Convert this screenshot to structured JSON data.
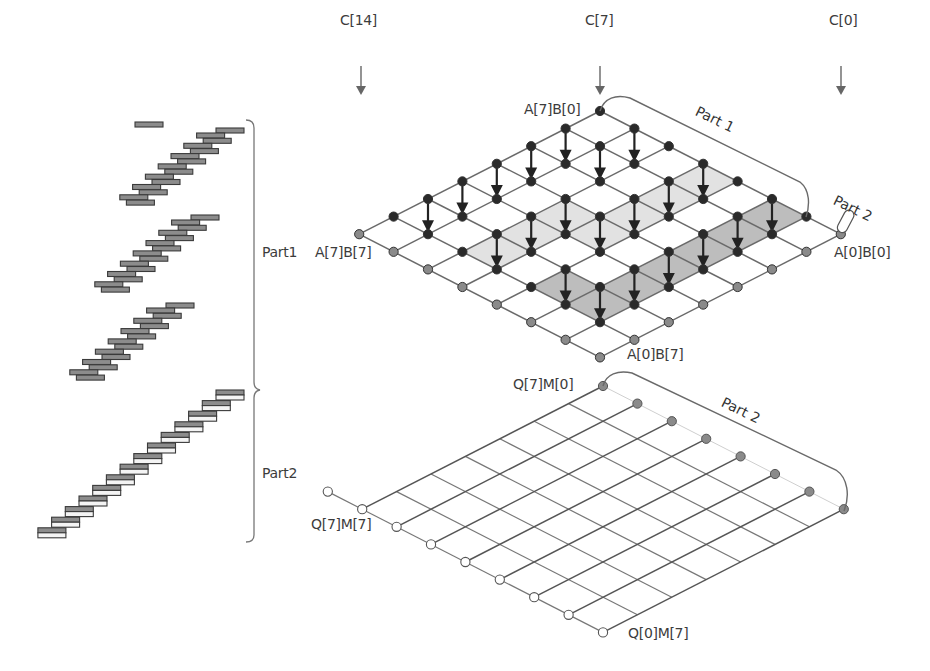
{
  "labels": {
    "c14": "C[14]",
    "c7": "C[7]",
    "c0": "C[0]",
    "a7b0": "A[7]B[0]",
    "a7b7": "A[7]B[7]",
    "a0b0": "A[0]B[0]",
    "a0b7": "A[0]B[7]",
    "q7m0": "Q[7]M[0]",
    "q7m7": "Q[7]M[7]",
    "q0m7": "Q[0]M[7]",
    "part1_grid": "Part 1",
    "part2_small": "Part 2",
    "part2_grid": "Part 2",
    "part1_brace": "Part1",
    "part2_brace": "Part2"
  },
  "colors": {
    "line": "#6a6a6a",
    "node_black": "#2a2a2a",
    "node_grey": "#8a8a8a",
    "node_white": "#ffffff",
    "shade_light": "#e2e2e2",
    "shade_dark": "#bdbdbd",
    "bar_fill": "#8c8c8c",
    "bar_stroke": "#3a3a3a"
  },
  "top_grid": {
    "origin": [
      600,
      111
    ],
    "step": [
      34.4,
      17.6
    ],
    "size": 8,
    "arrows": [
      [
        0,
        1
      ],
      [
        0,
        2
      ],
      [
        0,
        3
      ],
      [
        0,
        4
      ],
      [
        0,
        5
      ],
      [
        1,
        0
      ],
      [
        1,
        1
      ],
      [
        2,
        3
      ],
      [
        2,
        4
      ],
      [
        2,
        5
      ],
      [
        3,
        0
      ],
      [
        3,
        1
      ],
      [
        3,
        2
      ],
      [
        3,
        3
      ],
      [
        4,
        5
      ],
      [
        5,
        0
      ],
      [
        5,
        1
      ],
      [
        5,
        2
      ],
      [
        5,
        3
      ],
      [
        5,
        4
      ],
      [
        5,
        5
      ]
    ],
    "shade_light": [
      [
        2,
        3
      ],
      [
        2,
        4
      ],
      [
        2,
        5
      ],
      [
        3,
        0
      ],
      [
        3,
        1
      ],
      [
        3,
        2
      ],
      [
        3,
        3
      ]
    ],
    "shade_dark": [
      [
        4,
        5
      ],
      [
        5,
        0
      ],
      [
        5,
        1
      ],
      [
        5,
        2
      ],
      [
        5,
        3
      ],
      [
        5,
        4
      ],
      [
        5,
        5
      ]
    ]
  },
  "bottom_grid": {
    "origin": [
      603,
      386
    ],
    "step": [
      34.4,
      17.6
    ],
    "size": 8
  },
  "column_arrows": [
    {
      "label_key": "c14",
      "x": 361
    },
    {
      "label_key": "c7",
      "x": 600
    },
    {
      "label_key": "c0",
      "x": 841
    }
  ],
  "staircases": [
    {
      "type": "single",
      "bars": 1,
      "start": [
        135,
        122
      ]
    },
    {
      "type": "part1",
      "steps": 8,
      "top": [
        216,
        128
      ],
      "dx": -12.8,
      "dy": 10.3
    },
    {
      "type": "part1",
      "steps": 8,
      "top": [
        191,
        215
      ],
      "dx": -12.8,
      "dy": 10.3
    },
    {
      "type": "part1",
      "steps": 8,
      "top": [
        166,
        303
      ],
      "dx": -12.8,
      "dy": 10.3
    },
    {
      "type": "part2",
      "steps": 14,
      "top": [
        216,
        390
      ],
      "dx": -13.7,
      "dy": 10.6
    }
  ]
}
